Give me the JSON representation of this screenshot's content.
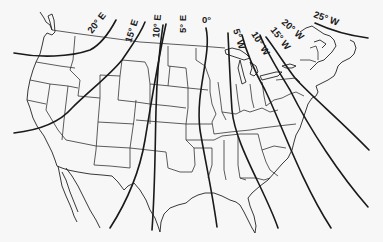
{
  "map": {
    "title": "Isogonic lines (magnetic declination) over the United States",
    "background": "#f7f7f7",
    "line_color": "#1a1a1a",
    "isogonic_lines": [
      {
        "label": "20° E",
        "value": 20,
        "direction": "E",
        "path": "M14,53 C40,58 70,57 90,50 C100,45 108,35 116,20",
        "label_x": 92,
        "label_y": 34,
        "label_rot": -52
      },
      {
        "label": "15° E",
        "value": 15,
        "direction": "E",
        "path": "M14,133 C40,130 60,122 72,108 C88,92 110,75 122,60 C132,45 140,35 145,22",
        "label_x": 131,
        "label_y": 43,
        "label_rot": -72
      },
      {
        "label": "10° E",
        "value": 10,
        "direction": "E",
        "path": "M110,228 C128,200 140,170 145,140 C150,110 158,60 166,24",
        "label_x": 159,
        "label_y": 38,
        "label_rot": -85
      },
      {
        "label": "5° E",
        "value": 5,
        "direction": "E",
        "path": "M152,230 C155,190 155,150 156,110 C157,70 160,45 163,25",
        "label_x": 186,
        "label_y": 33,
        "label_rot": -90
      },
      {
        "label": "0°",
        "value": 0,
        "direction": "",
        "path": "M217,227 C212,190 205,160 200,130 C195,90 212,55 206,28",
        "label_x": 202,
        "label_y": 23,
        "label_rot": 0
      },
      {
        "label": "5° W",
        "value": 5,
        "direction": "W",
        "path": "M278,228 C265,190 235,145 232,110 C230,80 229,55 228,33",
        "label_x": 233,
        "label_y": 30,
        "label_rot": 72
      },
      {
        "label": "10° W",
        "value": 10,
        "direction": "W",
        "path": "M331,228 C300,180 280,120 265,90 C255,72 247,55 242,35",
        "label_x": 251,
        "label_y": 34,
        "label_rot": 58
      },
      {
        "label": "15° W",
        "value": 15,
        "direction": "W",
        "path": "M368,207 C340,175 310,130 290,90 C278,70 268,55 260,35",
        "label_x": 270,
        "label_y": 30,
        "label_rot": 52
      },
      {
        "label": "20° W",
        "value": 20,
        "direction": "W",
        "path": "M369,150 C340,120 310,95 295,78 C285,65 276,50 266,37",
        "label_x": 281,
        "label_y": 23,
        "label_rot": 42
      },
      {
        "label": "25° W",
        "value": 25,
        "direction": "W",
        "path": "M315,23 C330,30 345,35 368,38",
        "label_x": 313,
        "label_y": 17,
        "label_rot": 20
      }
    ]
  }
}
